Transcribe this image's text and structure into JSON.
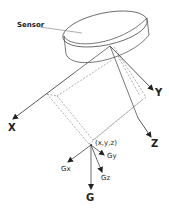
{
  "diagram": {
    "sensor_label": "Sensor",
    "axes": {
      "x": "X",
      "y": "Y",
      "z": "Z"
    },
    "point_label": "(x,y,z)",
    "gravity": {
      "g": "G",
      "gx": "Gx",
      "gy": "Gy",
      "gz": "Gz"
    },
    "colors": {
      "line": "#555555",
      "arrow": "#222222",
      "text": "#222222"
    }
  }
}
